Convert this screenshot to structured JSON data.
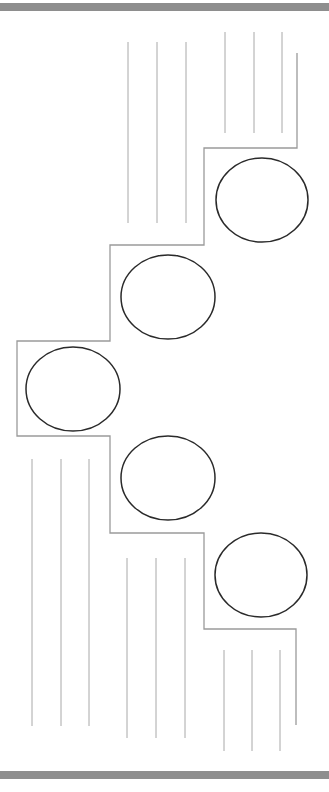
{
  "canvas": {
    "width": 329,
    "height": 792,
    "background": "#ffffff"
  },
  "colors": {
    "band": "#8e8e8e",
    "outline": "#9a9a9a",
    "circle": "#2a2a2a",
    "lines": "#a8a8a8"
  },
  "bands": {
    "top": {
      "y": 3,
      "h": 8
    },
    "bottom": {
      "y": 771,
      "h": 8
    }
  },
  "stair_outline": {
    "points": [
      [
        297,
        53
      ],
      [
        297,
        148
      ],
      [
        204,
        148
      ],
      [
        204,
        245
      ],
      [
        110,
        245
      ],
      [
        110,
        341
      ],
      [
        17,
        341
      ],
      [
        17,
        436
      ],
      [
        110,
        436
      ],
      [
        110,
        533
      ],
      [
        204,
        533
      ],
      [
        204,
        629
      ],
      [
        296,
        629
      ],
      [
        296,
        725
      ]
    ]
  },
  "circles": [
    {
      "cx": 262,
      "cy": 200,
      "rx": 46,
      "ry": 42
    },
    {
      "cx": 168,
      "cy": 297,
      "rx": 47,
      "ry": 42
    },
    {
      "cx": 73,
      "cy": 389,
      "rx": 47,
      "ry": 42
    },
    {
      "cx": 168,
      "cy": 478,
      "rx": 47,
      "ry": 42
    },
    {
      "cx": 261,
      "cy": 575,
      "rx": 46,
      "ry": 42
    }
  ],
  "line_groups": [
    {
      "name": "top-left",
      "xs": [
        128,
        157,
        186
      ],
      "y1": 42,
      "y2": 223
    },
    {
      "name": "top-right",
      "xs": [
        225,
        254,
        282
      ],
      "y1": 32,
      "y2": 133
    },
    {
      "name": "left",
      "xs": [
        32,
        61,
        89
      ],
      "y1": 459,
      "y2": 726
    },
    {
      "name": "middle",
      "xs": [
        127,
        156,
        185
      ],
      "y1": 558,
      "y2": 738
    },
    {
      "name": "right",
      "xs": [
        224,
        252,
        280
      ],
      "y1": 650,
      "y2": 751
    }
  ]
}
